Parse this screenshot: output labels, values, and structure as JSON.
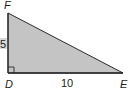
{
  "diagram": {
    "type": "right-triangle",
    "fill_color": "#c4c4c4",
    "stroke_color": "#2a2a2a",
    "vertices": {
      "F": {
        "label": "F",
        "x": 8,
        "y": 13
      },
      "D": {
        "label": "D",
        "x": 8,
        "y": 73
      },
      "E": {
        "label": "E",
        "x": 123,
        "y": 73
      }
    },
    "right_angle_at": "D",
    "sides": {
      "DF": {
        "label": "5"
      },
      "DE": {
        "label": "10"
      },
      "FE": {
        "label": ""
      }
    }
  }
}
